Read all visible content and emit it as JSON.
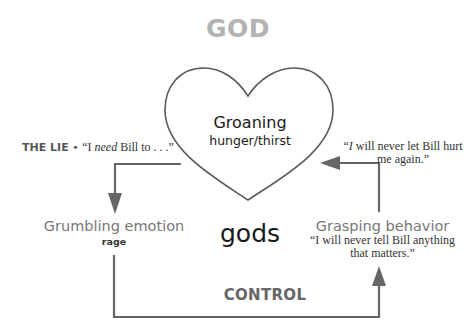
{
  "title": "GOD",
  "heart": {
    "title": "Groaning",
    "subtitle": "hunger/thirst"
  },
  "center_label": "gods",
  "the_lie": {
    "label": "THE LIE",
    "bullet": "•",
    "quote_open": "“I ",
    "quote_emphasis": "need",
    "quote_rest": " Bill to . . .”"
  },
  "right_quote": {
    "open": "“",
    "emphasis": "I",
    "rest": " will never let Bill hurt me again.”"
  },
  "grumbling": {
    "title": "Grumbling emotion",
    "subtitle": "rage"
  },
  "grasping": {
    "title": "Grasping behavior",
    "quote": "“I will never tell Bill anything that matters.”"
  },
  "control_label": "CONTROL",
  "colors": {
    "title_gray": "#b3b3b3",
    "line_gray": "#666666",
    "heart_stroke": "#5a5a5a",
    "text_dark": "#1a1a1a",
    "label_gray": "#777777"
  },
  "icons": {
    "heart": "heart-shape",
    "arrow_down": "arrow-down-icon",
    "arrow_left": "arrow-left-icon",
    "arrow_up": "arrow-up-icon"
  }
}
